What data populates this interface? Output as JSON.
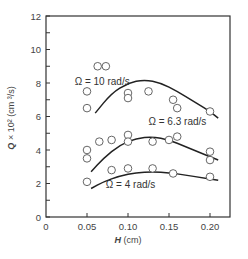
{
  "chart_data": {
    "type": "scatter",
    "title": "",
    "xlabel": "H (cm)",
    "ylabel": "Q × 10² (cm³/s)",
    "xlim": [
      0,
      0.225
    ],
    "ylim": [
      0,
      12
    ],
    "grid": false,
    "legend": "none (inline curve annotations)",
    "x_ticks": [
      "0",
      "0.05",
      "0.10",
      "0.15",
      "0.20"
    ],
    "x_tick_values": [
      0,
      0.05,
      0.1,
      0.15,
      0.2
    ],
    "y_ticks": [
      "0",
      "2",
      "4",
      "6",
      "8",
      "10",
      "12"
    ],
    "y_tick_values": [
      0,
      2,
      4,
      6,
      8,
      10,
      12
    ],
    "series": [
      {
        "name": "Ω = 10 rad/s",
        "marker": "open-circle",
        "points": [
          [
            0.05,
            7.5
          ],
          [
            0.05,
            6.5
          ],
          [
            0.063,
            9.0
          ],
          [
            0.073,
            9.0
          ],
          [
            0.1,
            7.4
          ],
          [
            0.1,
            7.1
          ],
          [
            0.125,
            7.5
          ],
          [
            0.155,
            7.0
          ],
          [
            0.16,
            6.5
          ],
          [
            0.2,
            6.3
          ]
        ],
        "curve": [
          [
            0.06,
            6.2
          ],
          [
            0.08,
            7.4
          ],
          [
            0.1,
            8.0
          ],
          [
            0.12,
            8.2
          ],
          [
            0.14,
            8.0
          ],
          [
            0.16,
            7.5
          ],
          [
            0.18,
            6.9
          ],
          [
            0.2,
            6.3
          ],
          [
            0.21,
            5.9
          ]
        ]
      },
      {
        "name": "Ω = 6.3 rad/s",
        "marker": "open-circle",
        "points": [
          [
            0.05,
            4.0
          ],
          [
            0.05,
            3.5
          ],
          [
            0.065,
            4.5
          ],
          [
            0.08,
            4.6
          ],
          [
            0.1,
            4.9
          ],
          [
            0.1,
            4.5
          ],
          [
            0.13,
            4.5
          ],
          [
            0.15,
            4.6
          ],
          [
            0.16,
            4.8
          ],
          [
            0.2,
            3.9
          ],
          [
            0.2,
            3.4
          ]
        ],
        "curve": [
          [
            0.055,
            2.7
          ],
          [
            0.07,
            3.5
          ],
          [
            0.09,
            4.3
          ],
          [
            0.11,
            4.7
          ],
          [
            0.13,
            4.8
          ],
          [
            0.15,
            4.6
          ],
          [
            0.17,
            4.2
          ],
          [
            0.19,
            3.8
          ],
          [
            0.21,
            3.4
          ]
        ]
      },
      {
        "name": "Ω = 4 rad/s",
        "marker": "open-circle",
        "points": [
          [
            0.05,
            2.1
          ],
          [
            0.08,
            2.8
          ],
          [
            0.1,
            2.9
          ],
          [
            0.13,
            2.9
          ],
          [
            0.155,
            2.6
          ],
          [
            0.2,
            2.4
          ]
        ],
        "curve": [
          [
            0.055,
            1.7
          ],
          [
            0.07,
            2.1
          ],
          [
            0.09,
            2.45
          ],
          [
            0.11,
            2.65
          ],
          [
            0.13,
            2.7
          ],
          [
            0.15,
            2.65
          ],
          [
            0.17,
            2.5
          ],
          [
            0.19,
            2.35
          ],
          [
            0.21,
            2.2
          ]
        ]
      }
    ],
    "annotations": [
      {
        "text": "Ω = 10 rad/s",
        "x": 0.035,
        "y": 7.9
      },
      {
        "text": "Ω = 6.3 rad/s",
        "x": 0.125,
        "y": 5.5
      },
      {
        "text": "Ω = 4 rad/s",
        "x": 0.073,
        "y": 1.75
      }
    ]
  },
  "labels": {
    "x_axis_title_italic": "H",
    "x_axis_title_unit": " (cm)",
    "y_axis_title_italic": "Q",
    "y_axis_title_rest": " × 10² (cm ³/s)"
  }
}
